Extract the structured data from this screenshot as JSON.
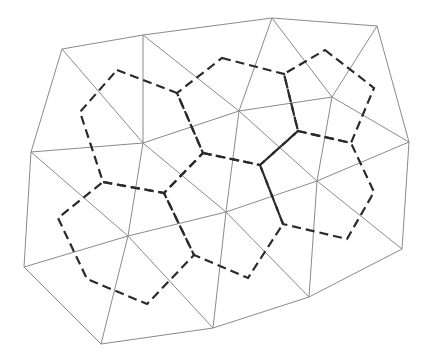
{
  "diagram": {
    "type": "triangulation-with-dual-voronoi",
    "colors": {
      "background": "#ffffff",
      "mesh_edge": "#8a8a8a",
      "dual_edge": "#2a2a2a"
    },
    "vertices": {
      "A": [
        62,
        49
      ],
      "B": [
        143,
        35
      ],
      "E": [
        272,
        18
      ],
      "F": [
        377,
        26
      ],
      "C": [
        31,
        152
      ],
      "D": [
        143,
        143
      ],
      "H": [
        239,
        111
      ],
      "G": [
        332,
        97
      ],
      "I": [
        409,
        142
      ],
      "K": [
        24,
        267
      ],
      "J": [
        128,
        236
      ],
      "O": [
        226,
        212
      ],
      "N": [
        317,
        181
      ],
      "P": [
        402,
        249
      ],
      "L": [
        101,
        344
      ],
      "Q": [
        213,
        328
      ],
      "M": [
        309,
        297
      ]
    },
    "edges": [
      [
        "A",
        "B"
      ],
      [
        "B",
        "E"
      ],
      [
        "E",
        "F"
      ],
      [
        "F",
        "I"
      ],
      [
        "I",
        "P"
      ],
      [
        "P",
        "M"
      ],
      [
        "M",
        "Q"
      ],
      [
        "Q",
        "L"
      ],
      [
        "L",
        "K"
      ],
      [
        "K",
        "C"
      ],
      [
        "C",
        "A"
      ],
      [
        "A",
        "D"
      ],
      [
        "B",
        "D"
      ],
      [
        "C",
        "D"
      ],
      [
        "B",
        "H"
      ],
      [
        "D",
        "H"
      ],
      [
        "E",
        "H"
      ],
      [
        "E",
        "G"
      ],
      [
        "H",
        "G"
      ],
      [
        "F",
        "G"
      ],
      [
        "G",
        "I"
      ],
      [
        "C",
        "J"
      ],
      [
        "D",
        "J"
      ],
      [
        "K",
        "J"
      ],
      [
        "J",
        "L"
      ],
      [
        "J",
        "Q"
      ],
      [
        "D",
        "O"
      ],
      [
        "H",
        "O"
      ],
      [
        "J",
        "O"
      ],
      [
        "O",
        "Q"
      ],
      [
        "H",
        "N"
      ],
      [
        "G",
        "N"
      ],
      [
        "I",
        "N"
      ],
      [
        "O",
        "N"
      ],
      [
        "N",
        "M"
      ],
      [
        "O",
        "M"
      ],
      [
        "N",
        "P"
      ]
    ],
    "dual_cells": [
      [
        [
          117,
          70
        ],
        [
          177,
          93
        ],
        [
          203,
          153
        ],
        [
          164,
          193
        ],
        [
          103,
          182
        ],
        [
          80,
          112
        ]
      ],
      [
        [
          222,
          58
        ],
        [
          284,
          74
        ],
        [
          298,
          131
        ],
        [
          260,
          165
        ],
        [
          203,
          153
        ],
        [
          177,
          93
        ]
      ],
      [
        [
          325,
          50
        ],
        [
          374,
          88
        ],
        [
          351,
          143
        ],
        [
          298,
          131
        ],
        [
          284,
          74
        ]
      ],
      [
        [
          298,
          131
        ],
        [
          351,
          143
        ],
        [
          374,
          192
        ],
        [
          347,
          239
        ],
        [
          283,
          224
        ],
        [
          260,
          165
        ]
      ],
      [
        [
          203,
          153
        ],
        [
          260,
          165
        ],
        [
          283,
          224
        ],
        [
          248,
          278
        ],
        [
          194,
          255
        ],
        [
          164,
          193
        ]
      ],
      [
        [
          103,
          182
        ],
        [
          164,
          193
        ],
        [
          194,
          255
        ],
        [
          147,
          304
        ],
        [
          87,
          279
        ],
        [
          58,
          218
        ]
      ]
    ]
  }
}
